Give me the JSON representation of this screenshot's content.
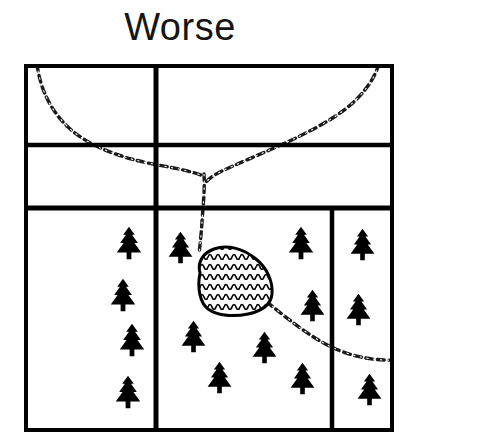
{
  "figure": {
    "title": "Worse",
    "caption_label": "landscape-fragmentation-diagram",
    "background_color": "#ffffff",
    "ink_color": "#000000"
  },
  "map": {
    "frame": {
      "x": 26,
      "y": 66,
      "width": 366,
      "height": 364,
      "stroke_width": 4
    },
    "stroke_color": "#000000",
    "fill_color": "#ffffff",
    "parcel_lines": {
      "horizontal": [
        {
          "name": "upper-divider",
          "y": 145,
          "x1": 26,
          "x2": 392,
          "stroke_width": 4
        },
        {
          "name": "lower-divider",
          "y": 208,
          "x1": 26,
          "x2": 392,
          "stroke_width": 5
        }
      ],
      "vertical": [
        {
          "name": "main-divider",
          "x": 156,
          "y1": 66,
          "y2": 430,
          "stroke_width": 5
        },
        {
          "name": "right-divider",
          "x": 332,
          "y1": 208,
          "y2": 430,
          "stroke_width": 4
        }
      ]
    },
    "parcels": [
      {
        "id": "parcel-top-left",
        "label": "top-left",
        "x": 26,
        "y": 66,
        "width": 130,
        "height": 79,
        "trees": 0
      },
      {
        "id": "parcel-top-right",
        "label": "top-right",
        "x": 156,
        "y": 66,
        "width": 236,
        "height": 79,
        "trees": 0
      },
      {
        "id": "parcel-mid-left",
        "label": "middle-left",
        "x": 26,
        "y": 145,
        "width": 130,
        "height": 63,
        "trees": 0
      },
      {
        "id": "parcel-mid-right",
        "label": "middle-right",
        "x": 156,
        "y": 145,
        "width": 236,
        "height": 63,
        "trees": 0
      },
      {
        "id": "parcel-bottom-left",
        "label": "bottom-left",
        "x": 26,
        "y": 208,
        "width": 130,
        "height": 222,
        "trees": 4
      },
      {
        "id": "parcel-bottom-center",
        "label": "bottom-center",
        "x": 156,
        "y": 208,
        "width": 176,
        "height": 222,
        "trees": 7
      },
      {
        "id": "parcel-bottom-right",
        "label": "bottom-right",
        "x": 332,
        "y": 208,
        "width": 60,
        "height": 222,
        "trees": 3
      }
    ],
    "pond": {
      "name": "pond",
      "hatch": "wavy",
      "stroke_width": 3,
      "outline": [
        [
          201,
          272
        ],
        [
          199,
          264
        ],
        [
          203,
          256
        ],
        [
          212,
          251
        ],
        [
          224,
          249
        ],
        [
          238,
          251
        ],
        [
          250,
          257
        ],
        [
          259,
          266
        ],
        [
          266,
          277
        ],
        [
          270,
          288
        ],
        [
          271,
          298
        ],
        [
          266,
          306
        ],
        [
          256,
          311
        ],
        [
          243,
          314
        ],
        [
          229,
          315
        ],
        [
          217,
          313
        ],
        [
          207,
          307
        ],
        [
          200,
          297
        ],
        [
          197,
          286
        ]
      ]
    },
    "streams": [
      {
        "name": "stream-northwest-branch",
        "points": [
          [
            37,
            66
          ],
          [
            42,
            82
          ],
          [
            49,
            98
          ],
          [
            58,
            113
          ],
          [
            70,
            126
          ],
          [
            85,
            137
          ],
          [
            102,
            146
          ],
          [
            122,
            154
          ],
          [
            144,
            161
          ],
          [
            167,
            166
          ],
          [
            188,
            169
          ],
          [
            203,
            173
          ]
        ]
      },
      {
        "name": "stream-northeast-branch",
        "points": [
          [
            378,
            66
          ],
          [
            370,
            79
          ],
          [
            358,
            93
          ],
          [
            344,
            106
          ],
          [
            328,
            118
          ],
          [
            309,
            129
          ],
          [
            288,
            140
          ],
          [
            267,
            150
          ],
          [
            246,
            159
          ],
          [
            227,
            168
          ],
          [
            213,
            176
          ],
          [
            205,
            182
          ]
        ]
      },
      {
        "name": "stream-outflow-south",
        "points": [
          [
            204,
            175
          ],
          [
            204,
            186
          ],
          [
            203,
            198
          ],
          [
            202,
            210
          ],
          [
            201,
            222
          ],
          [
            200,
            234
          ],
          [
            199,
            244
          ],
          [
            199,
            252
          ]
        ]
      },
      {
        "name": "stream-outflow-southeast",
        "points": [
          [
            268,
            303
          ],
          [
            281,
            312
          ],
          [
            293,
            321
          ],
          [
            304,
            330
          ],
          [
            314,
            338
          ],
          [
            325,
            345
          ],
          [
            337,
            352
          ],
          [
            350,
            357
          ],
          [
            365,
            360
          ],
          [
            380,
            361
          ],
          [
            392,
            360
          ]
        ]
      }
    ],
    "trees": [
      {
        "parcel": "parcel-bottom-left",
        "x": 129,
        "y": 243,
        "size": 34
      },
      {
        "parcel": "parcel-bottom-left",
        "x": 123,
        "y": 295,
        "size": 34
      },
      {
        "parcel": "parcel-bottom-left",
        "x": 132,
        "y": 340,
        "size": 34
      },
      {
        "parcel": "parcel-bottom-left",
        "x": 128,
        "y": 392,
        "size": 34
      },
      {
        "parcel": "parcel-bottom-center",
        "x": 180,
        "y": 248,
        "size": 33
      },
      {
        "parcel": "parcel-bottom-center",
        "x": 300,
        "y": 243,
        "size": 34
      },
      {
        "parcel": "parcel-bottom-center",
        "x": 312,
        "y": 305,
        "size": 33
      },
      {
        "parcel": "parcel-bottom-center",
        "x": 193,
        "y": 337,
        "size": 33
      },
      {
        "parcel": "parcel-bottom-center",
        "x": 264,
        "y": 348,
        "size": 33
      },
      {
        "parcel": "parcel-bottom-center",
        "x": 219,
        "y": 378,
        "size": 33
      },
      {
        "parcel": "parcel-bottom-center",
        "x": 302,
        "y": 379,
        "size": 33
      },
      {
        "parcel": "parcel-bottom-right",
        "x": 362,
        "y": 245,
        "size": 33
      },
      {
        "parcel": "parcel-bottom-right",
        "x": 358,
        "y": 310,
        "size": 33
      },
      {
        "parcel": "parcel-bottom-right",
        "x": 369,
        "y": 390,
        "size": 33
      }
    ]
  }
}
